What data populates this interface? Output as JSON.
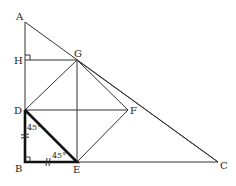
{
  "diagram": {
    "type": "geometry",
    "points": {
      "A": "A",
      "H": "H",
      "G": "G",
      "D": "D",
      "F": "F",
      "B": "B",
      "E": "E",
      "C": "C"
    },
    "angle_labels": {
      "at_D": "45°",
      "at_E": "45°"
    },
    "segments": [
      "AB",
      "BC",
      "AC",
      "HG",
      "GE",
      "DF",
      "DG",
      "GF",
      "DE",
      "EF",
      "BD",
      "BE"
    ],
    "highlighted_triangle": "DBE",
    "right_angles": [
      "H",
      "B"
    ],
    "equal_marks": [
      "BD",
      "BE"
    ]
  }
}
